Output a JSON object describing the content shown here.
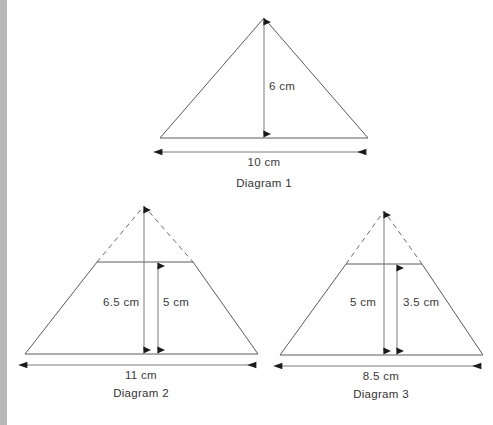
{
  "page": {
    "background_color": "#ffffff",
    "left_strip_color": "#b9b9b9",
    "stroke_color": "#5a5a5a",
    "text_color": "#333333"
  },
  "diagrams": [
    {
      "id": "diagram-1",
      "caption": "Diagram 1",
      "shape": "triangle",
      "labels": {
        "height": "6 cm",
        "base": "10 cm"
      },
      "measurements": [
        {
          "name": "height",
          "value": 6,
          "unit": "cm",
          "orientation": "vertical"
        },
        {
          "name": "base",
          "value": 10,
          "unit": "cm",
          "orientation": "horizontal"
        }
      ]
    },
    {
      "id": "diagram-2",
      "caption": "Diagram 2",
      "shape": "trapezium-with-dashed-apex",
      "labels": {
        "full_height": "6.5 cm",
        "trapezium_height": "5 cm",
        "base": "11 cm"
      },
      "measurements": [
        {
          "name": "full_height",
          "value": 6.5,
          "unit": "cm",
          "orientation": "vertical"
        },
        {
          "name": "trapezium_height",
          "value": 5,
          "unit": "cm",
          "orientation": "vertical"
        },
        {
          "name": "base",
          "value": 11,
          "unit": "cm",
          "orientation": "horizontal"
        }
      ]
    },
    {
      "id": "diagram-3",
      "caption": "Diagram 3",
      "shape": "trapezium-with-dashed-apex",
      "labels": {
        "full_height": "5 cm",
        "trapezium_height": "3.5 cm",
        "base": "8.5 cm"
      },
      "measurements": [
        {
          "name": "full_height",
          "value": 5,
          "unit": "cm",
          "orientation": "vertical"
        },
        {
          "name": "trapezium_height",
          "value": 3.5,
          "unit": "cm",
          "orientation": "vertical"
        },
        {
          "name": "base",
          "value": 8.5,
          "unit": "cm",
          "orientation": "horizontal"
        }
      ]
    }
  ]
}
